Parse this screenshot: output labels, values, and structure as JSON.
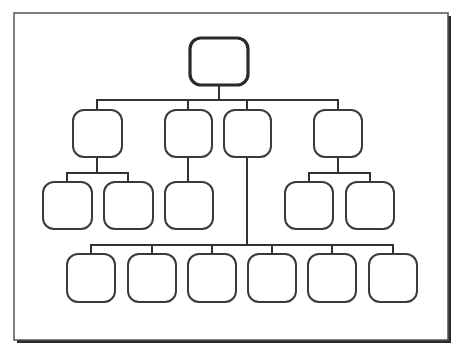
{
  "diagram": {
    "type": "org-chart",
    "frame": {
      "x": 14,
      "y": 13,
      "w": 434,
      "h": 327,
      "stroke": "#555555",
      "shadow": "#2a2a2a"
    },
    "colors": {
      "line": "#333333",
      "node_fill": "#ffffff",
      "node_stroke": "#3a3a3a",
      "root_stroke": "#2a2a2a"
    },
    "nodes": [
      {
        "id": "root",
        "label": "",
        "x": 190,
        "y": 38,
        "w": 58,
        "h": 47,
        "root": true
      },
      {
        "id": "l1-a",
        "label": "",
        "x": 73,
        "y": 110,
        "w": 49,
        "h": 47
      },
      {
        "id": "l1-b",
        "label": "",
        "x": 165,
        "y": 110,
        "w": 47,
        "h": 47
      },
      {
        "id": "l1-c",
        "label": "",
        "x": 224,
        "y": 110,
        "w": 47,
        "h": 47
      },
      {
        "id": "l1-d",
        "label": "",
        "x": 314,
        "y": 110,
        "w": 48,
        "h": 47
      },
      {
        "id": "a-1",
        "label": "",
        "x": 43,
        "y": 182,
        "w": 49,
        "h": 47
      },
      {
        "id": "a-2",
        "label": "",
        "x": 104,
        "y": 182,
        "w": 49,
        "h": 47
      },
      {
        "id": "b-1",
        "label": "",
        "x": 165,
        "y": 182,
        "w": 48,
        "h": 47
      },
      {
        "id": "d-1",
        "label": "",
        "x": 285,
        "y": 182,
        "w": 48,
        "h": 47
      },
      {
        "id": "d-2",
        "label": "",
        "x": 346,
        "y": 182,
        "w": 48,
        "h": 47
      },
      {
        "id": "c-1",
        "label": "",
        "x": 67,
        "y": 254,
        "w": 48,
        "h": 48
      },
      {
        "id": "c-2",
        "label": "",
        "x": 128,
        "y": 254,
        "w": 48,
        "h": 48
      },
      {
        "id": "c-3",
        "label": "",
        "x": 188,
        "y": 254,
        "w": 48,
        "h": 48
      },
      {
        "id": "c-4",
        "label": "",
        "x": 248,
        "y": 254,
        "w": 48,
        "h": 48
      },
      {
        "id": "c-5",
        "label": "",
        "x": 308,
        "y": 254,
        "w": 48,
        "h": 48
      },
      {
        "id": "c-6",
        "label": "",
        "x": 369,
        "y": 254,
        "w": 48,
        "h": 48
      }
    ],
    "connectors": [
      {
        "points": [
          [
            219,
            85
          ],
          [
            219,
            100
          ]
        ]
      },
      {
        "points": [
          [
            97,
            100
          ],
          [
            338,
            100
          ]
        ]
      },
      {
        "points": [
          [
            97,
            100
          ],
          [
            97,
            110
          ]
        ]
      },
      {
        "points": [
          [
            188,
            100
          ],
          [
            188,
            110
          ]
        ]
      },
      {
        "points": [
          [
            247,
            100
          ],
          [
            247,
            110
          ]
        ]
      },
      {
        "points": [
          [
            338,
            100
          ],
          [
            338,
            110
          ]
        ]
      },
      {
        "points": [
          [
            97,
            157
          ],
          [
            97,
            173
          ]
        ]
      },
      {
        "points": [
          [
            67,
            173
          ],
          [
            128,
            173
          ]
        ]
      },
      {
        "points": [
          [
            67,
            173
          ],
          [
            67,
            182
          ]
        ]
      },
      {
        "points": [
          [
            128,
            173
          ],
          [
            128,
            182
          ]
        ]
      },
      {
        "points": [
          [
            188,
            157
          ],
          [
            188,
            182
          ]
        ]
      },
      {
        "points": [
          [
            338,
            157
          ],
          [
            338,
            173
          ]
        ]
      },
      {
        "points": [
          [
            309,
            173
          ],
          [
            370,
            173
          ]
        ]
      },
      {
        "points": [
          [
            309,
            173
          ],
          [
            309,
            182
          ]
        ]
      },
      {
        "points": [
          [
            370,
            173
          ],
          [
            370,
            182
          ]
        ]
      },
      {
        "points": [
          [
            247,
            157
          ],
          [
            247,
            245
          ]
        ]
      },
      {
        "points": [
          [
            91,
            245
          ],
          [
            393,
            245
          ]
        ]
      },
      {
        "points": [
          [
            91,
            245
          ],
          [
            91,
            254
          ]
        ]
      },
      {
        "points": [
          [
            152,
            245
          ],
          [
            152,
            254
          ]
        ]
      },
      {
        "points": [
          [
            212,
            245
          ],
          [
            212,
            254
          ]
        ]
      },
      {
        "points": [
          [
            272,
            245
          ],
          [
            272,
            254
          ]
        ]
      },
      {
        "points": [
          [
            332,
            245
          ],
          [
            332,
            254
          ]
        ]
      },
      {
        "points": [
          [
            393,
            245
          ],
          [
            393,
            254
          ]
        ]
      }
    ]
  }
}
